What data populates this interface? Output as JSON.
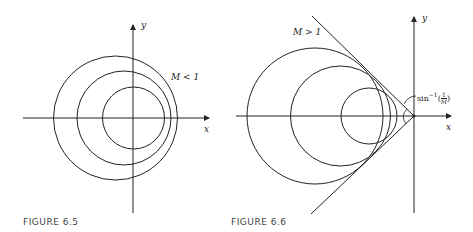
{
  "figures": [
    {
      "caption": "FIGURE 6.5",
      "axes": {
        "x_label": "x",
        "y_label": "y"
      },
      "annotation": "M < 1",
      "description": "Three non-concentric circles (wavefronts) for subsonic motion, M < 1"
    },
    {
      "caption": "FIGURE 6.6",
      "axes": {
        "x_label": "x",
        "y_label": "y"
      },
      "annotation": "M > 1",
      "angle_label": "sin⁻¹(1/M)",
      "angle_label_parts": {
        "func": "sin",
        "exp": "−1",
        "num": "1",
        "den": "M"
      },
      "description": "Three circles enclosed by a Mach cone formed by two tangent lines for supersonic motion, M > 1"
    }
  ],
  "colors": {
    "ink": "#222222",
    "caption": "#444444",
    "background": "#ffffff"
  }
}
